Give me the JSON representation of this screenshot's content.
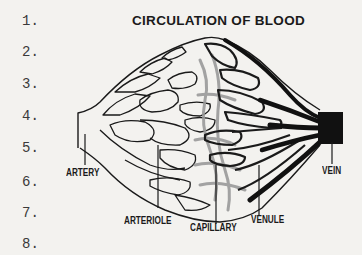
{
  "title": "CIRCULATION OF BLOOD",
  "answer_blanks": [
    {
      "label": "1.",
      "top": 14
    },
    {
      "label": "2.",
      "top": 45
    },
    {
      "label": "3.",
      "top": 77
    },
    {
      "label": "4.",
      "top": 109
    },
    {
      "label": "5.",
      "top": 141
    },
    {
      "label": "6.",
      "top": 175
    },
    {
      "label": "7.",
      "top": 206
    },
    {
      "label": "8.",
      "top": 237
    }
  ],
  "labels": {
    "artery": "ARTERY",
    "arteriole": "ARTERIOLE",
    "capillary": "CAPILLARY",
    "venule": "VENULE",
    "vein": "VEIN"
  },
  "colors": {
    "background": "#f3f2ef",
    "ink": "#1a1a1a",
    "capillary_gray": "#9a9a9a",
    "vein_dark": "#111111"
  }
}
